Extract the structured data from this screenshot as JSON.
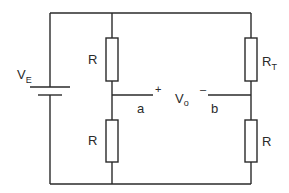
{
  "diagram": {
    "type": "wheatstone-bridge-circuit",
    "source": {
      "label_main": "V",
      "label_sub": "E"
    },
    "resistors": [
      {
        "id": "r-top-left",
        "label_main": "R",
        "label_sub": ""
      },
      {
        "id": "r-bottom-left",
        "label_main": "R",
        "label_sub": ""
      },
      {
        "id": "r-top-right",
        "label_main": "R",
        "label_sub": "T"
      },
      {
        "id": "r-bottom-right",
        "label_main": "R",
        "label_sub": ""
      }
    ],
    "output": {
      "label_main": "V",
      "label_sub": "o",
      "plus": "+",
      "minus": "–"
    },
    "nodes": {
      "a": "a",
      "b": "b"
    },
    "colors": {
      "line": "#2a2a2a",
      "background": "#ffffff"
    }
  }
}
